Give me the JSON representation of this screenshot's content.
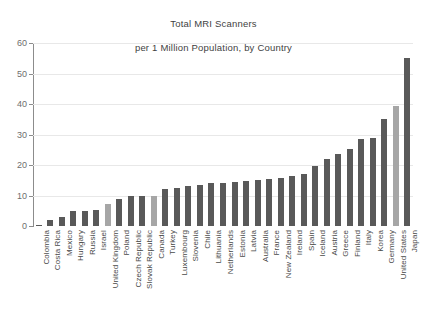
{
  "chart_data": {
    "type": "bar",
    "title": "Total MRI Scanners\nper 1 Million Population, by Country",
    "title_line1": "Total MRI Scanners",
    "title_line2": "per 1 Million Population, by Country",
    "xlabel": "",
    "ylabel": "",
    "ylim": [
      0,
      60
    ],
    "yticks": [
      0,
      10,
      20,
      30,
      40,
      50,
      60
    ],
    "ytick_labels": [
      "0",
      "10",
      "20",
      "30",
      "40",
      "50",
      "60"
    ],
    "grid": "horizontal",
    "legend": "none",
    "bar_color": "#595959",
    "highlight_color": "#a6a6a6",
    "highlighted_categories": [
      "United Kingdom",
      "Canada",
      "United States"
    ],
    "categories": [
      "Colombia",
      "Costa Rica",
      "Mexico",
      "Hungary",
      "Russia",
      "Israel",
      "United Kingdom",
      "Poland",
      "Czech Republic",
      "Slovak Republic",
      "Canada",
      "Turkey",
      "Luxembourg",
      "Slovenia",
      "Chile",
      "Lithuania",
      "Netherlands",
      "Estonia",
      "Latvia",
      "Australia",
      "France",
      "New Zealand",
      "Ireland",
      "Spain",
      "Iceland",
      "Austria",
      "Greece",
      "Finland",
      "Italy",
      "Korea",
      "Germany",
      "United States",
      "Japan"
    ],
    "values": [
      0.4,
      1.9,
      3.0,
      5.0,
      5.0,
      5.4,
      7.2,
      8.8,
      9.7,
      9.9,
      10.0,
      12.1,
      12.5,
      13.0,
      13.5,
      14.0,
      14.2,
      14.5,
      14.8,
      15.1,
      15.4,
      15.9,
      16.5,
      17.1,
      19.6,
      22.0,
      23.6,
      25.4,
      28.6,
      29.0,
      35.1,
      39.5,
      55.2
    ]
  }
}
